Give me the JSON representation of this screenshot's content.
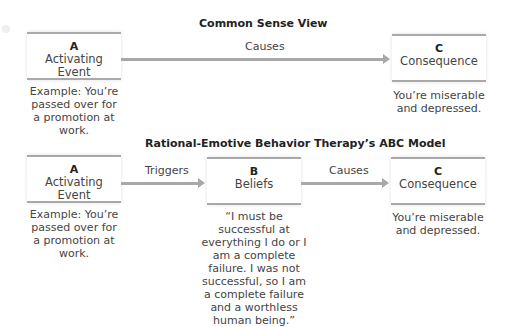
{
  "top_diagram": {
    "title": "Common Sense View",
    "box_a": {
      "letter": "A",
      "name": "Activating Event",
      "caption": "Example: You’re passed over for a promotion at work."
    },
    "arrow_ac": {
      "label": "Causes"
    },
    "box_c": {
      "letter": "C",
      "name": "Consequence",
      "caption": "You’re miserable and depressed."
    }
  },
  "bottom_diagram": {
    "title": "Rational-Emotive Behavior Therapy’s ABC Model",
    "box_a": {
      "letter": "A",
      "name": "Activating Event",
      "caption": "Example: You’re passed over for a promotion at work."
    },
    "arrow_ab": {
      "label": "Triggers"
    },
    "box_b": {
      "letter": "B",
      "name": "Beliefs",
      "caption": "“I must be successful at everything I do or I am a complete failure. I was not successful, so I am a complete failure and a worthless human being.”"
    },
    "arrow_bc": {
      "label": "Causes"
    },
    "box_c": {
      "letter": "C",
      "name": "Consequence",
      "caption": "You’re miserable and depressed."
    }
  },
  "colors": {
    "box_border": "#a9a9a9",
    "arrow": "#a8a8a8",
    "text": "#444444"
  }
}
